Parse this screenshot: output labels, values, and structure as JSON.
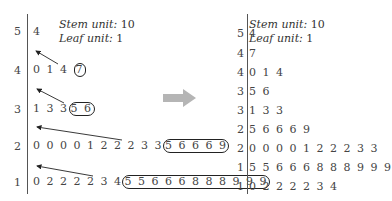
{
  "left": {
    "units": {
      "stem_label": "Stem unit:",
      "stem_value": "10",
      "leaf_label": "Leaf unit:",
      "leaf_value": "1"
    },
    "rows": [
      {
        "stem": "5",
        "leaves": "4",
        "circled": ""
      },
      {
        "stem": "4",
        "leaves": "0 1 4",
        "circled": "7"
      },
      {
        "stem": "3",
        "leaves": "1 3 3",
        "circled": "5 6"
      },
      {
        "stem": "2",
        "leaves": "0 0 0 0 1 2 2 2 3 3",
        "circled": "5 6 6 6 9"
      },
      {
        "stem": "1",
        "leaves": "0 2 2 2 2 3 4",
        "circled": "5 5 6 6 6 8 8 8 9 9 9"
      }
    ]
  },
  "arrow": {
    "color": "#b5b5b5",
    "direction": "right"
  },
  "right": {
    "units": {
      "stem_label": "Stem unit:",
      "stem_value": "10",
      "leaf_label": "Leaf unit:",
      "leaf_value": "1"
    },
    "rows": [
      {
        "stem": "5",
        "leaves": "4"
      },
      {
        "stem": "4",
        "leaves": "7"
      },
      {
        "stem": "4",
        "leaves": "0 1 4"
      },
      {
        "stem": "3",
        "leaves": "5 6"
      },
      {
        "stem": "3",
        "leaves": "1 3 3"
      },
      {
        "stem": "2",
        "leaves": "5 6 6 6 9"
      },
      {
        "stem": "2",
        "leaves": "0 0 0 0 1 2 2 2 3 3"
      },
      {
        "stem": "1",
        "leaves": "5 5 6 6 6 8 8 8 9 9 9"
      },
      {
        "stem": "1",
        "leaves": "0 2 2 2 2 3 4"
      }
    ]
  }
}
